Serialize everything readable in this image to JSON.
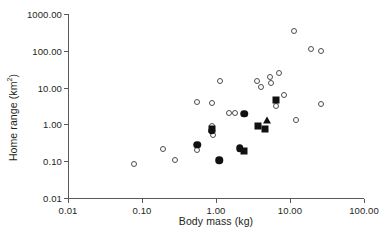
{
  "chart_data": {
    "type": "scatter",
    "title": "",
    "xlabel": "Body mass (kg)",
    "ylabel": "Home range (km²)",
    "xscale": "log",
    "yscale": "log",
    "xlim": [
      0.01,
      100.0
    ],
    "ylim": [
      0.01,
      1000.0
    ],
    "grid": false,
    "legend": "none",
    "xticks": [
      "0.01",
      "0.10",
      "1.00",
      "10.00",
      "100.00"
    ],
    "xtick_values": [
      0.01,
      0.1,
      1.0,
      10.0,
      100.0
    ],
    "yticks": [
      "0.01",
      "0.10",
      "1.00",
      "10.00",
      "100.00",
      "1000.00"
    ],
    "ytick_values": [
      0.01,
      0.1,
      1.0,
      10.0,
      100.0,
      1000.0
    ],
    "series": [
      {
        "name": "open-circle",
        "marker": "open circle",
        "color": "#4d4d4f",
        "points": [
          {
            "x": 0.078,
            "y": 0.082
          },
          {
            "x": 0.19,
            "y": 0.21
          },
          {
            "x": 0.28,
            "y": 0.105
          },
          {
            "x": 0.55,
            "y": 4.0
          },
          {
            "x": 0.56,
            "y": 0.2
          },
          {
            "x": 0.87,
            "y": 0.93
          },
          {
            "x": 0.88,
            "y": 3.7
          },
          {
            "x": 0.9,
            "y": 0.5
          },
          {
            "x": 1.15,
            "y": 15.0
          },
          {
            "x": 1.5,
            "y": 2.1
          },
          {
            "x": 1.8,
            "y": 2.1
          },
          {
            "x": 3.6,
            "y": 15.5
          },
          {
            "x": 4.1,
            "y": 10.2
          },
          {
            "x": 5.4,
            "y": 20.0
          },
          {
            "x": 5.5,
            "y": 13.0
          },
          {
            "x": 6.5,
            "y": 3.1
          },
          {
            "x": 7.0,
            "y": 25.0
          },
          {
            "x": 8.2,
            "y": 6.1
          },
          {
            "x": 11.5,
            "y": 350.0
          },
          {
            "x": 12.0,
            "y": 1.3
          },
          {
            "x": 19.0,
            "y": 112.0
          },
          {
            "x": 26.0,
            "y": 100.0
          },
          {
            "x": 26.5,
            "y": 3.5
          }
        ]
      },
      {
        "name": "filled-circle",
        "marker": "filled circle",
        "color": "#111111",
        "points": [
          {
            "x": 0.56,
            "y": 0.28
          },
          {
            "x": 0.87,
            "y": 0.68
          },
          {
            "x": 1.1,
            "y": 0.105
          },
          {
            "x": 2.1,
            "y": 0.225
          },
          {
            "x": 2.4,
            "y": 1.95
          }
        ]
      },
      {
        "name": "filled-square",
        "marker": "filled square",
        "color": "#111111",
        "points": [
          {
            "x": 0.88,
            "y": 0.74
          },
          {
            "x": 2.4,
            "y": 0.195
          },
          {
            "x": 3.7,
            "y": 0.88
          },
          {
            "x": 4.6,
            "y": 0.73
          },
          {
            "x": 6.4,
            "y": 4.7
          }
        ]
      },
      {
        "name": "filled-triangle",
        "marker": "filled triangle",
        "color": "#111111",
        "points": [
          {
            "x": 4.9,
            "y": 1.3
          }
        ]
      }
    ]
  }
}
